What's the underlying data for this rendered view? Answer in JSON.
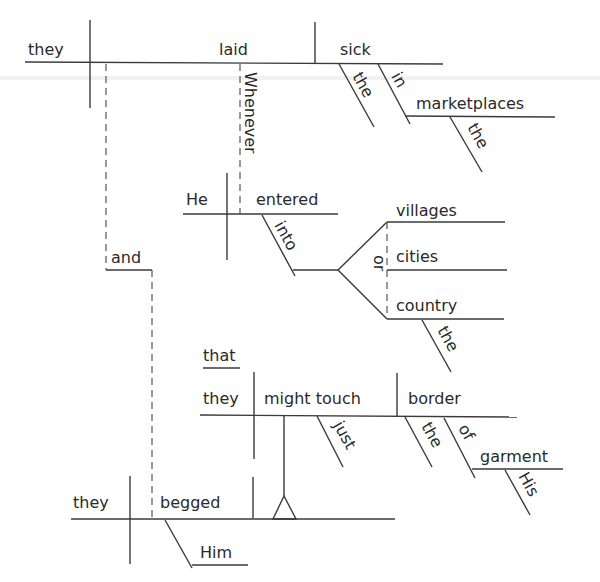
{
  "diagram": {
    "type": "sentence-diagram",
    "sentence": "Whenever He entered into villages or cities or the country, they laid the sick in the marketplaces, and they begged Him that they might just touch the border of His garment",
    "clause1": {
      "subject": "they",
      "verb": "laid",
      "object": "sick",
      "object_modifier": "the",
      "prep": "in",
      "prep_object": "marketplaces",
      "prep_object_modifier": "the"
    },
    "subordinator": "Whenever",
    "clause2": {
      "subject": "He",
      "verb": "entered",
      "prep": "into",
      "conjunction": "or",
      "compound_objects": [
        "villages",
        "cities",
        "country"
      ],
      "country_modifier": "the"
    },
    "coordinator": "and",
    "clause3": {
      "subject": "they",
      "verb": "begged",
      "indirect_object": "Him"
    },
    "noun_clause": {
      "introducer": "that",
      "subject": "they",
      "verb": "might touch",
      "adverb": "just",
      "object": "border",
      "object_modifier": "the",
      "prep": "of",
      "prep_object": "garment",
      "prep_object_modifier": "His"
    }
  }
}
